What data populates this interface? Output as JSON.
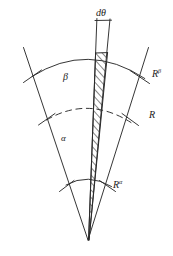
{
  "figure": {
    "type": "geometry-diagram",
    "background_color": "#ffffff",
    "stroke_color": "#2b2b2b",
    "apex": {
      "x": 88,
      "y": 240
    },
    "labels": {
      "d_theta": "dθ",
      "region_outer": "β",
      "region_inner": "α",
      "radius_outer_base": "R",
      "radius_outer_sup": "β",
      "radius_mid": "R",
      "radius_inner_base": "R",
      "radius_inner_sup": "α"
    },
    "arcs": [
      {
        "name": "outer-arc",
        "label": "Rβ",
        "radius": 192,
        "style": "solid"
      },
      {
        "name": "mid-arc",
        "label": "R",
        "radius": 140,
        "style": "dashed"
      },
      {
        "name": "inner-arc",
        "label": "Rα",
        "radius": 62,
        "style": "solid"
      }
    ],
    "strip": {
      "name": "d-theta-strip",
      "fill": "hatched",
      "hatch_direction": "lower-left-to-upper-right"
    }
  }
}
